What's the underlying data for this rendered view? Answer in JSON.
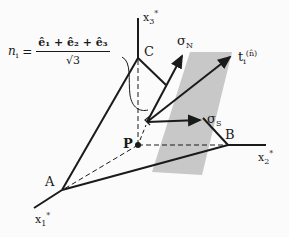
{
  "diagram": {
    "formula": {
      "lhs": "n",
      "lhs_sub": "i",
      "equals": "=",
      "numerator": "ê₁ + ê₂ + ê₃",
      "denominator": "√3"
    },
    "axes": {
      "x1": {
        "label": "x",
        "sub": "1",
        "sup": "*"
      },
      "x2": {
        "label": "x",
        "sub": "2",
        "sup": "*"
      },
      "x3": {
        "label": "x",
        "sub": "3",
        "sup": "*"
      }
    },
    "points": {
      "A": "A",
      "B": "B",
      "C": "C",
      "P": "P"
    },
    "vectors": {
      "sigma_n": {
        "label": "σ",
        "sub": "N"
      },
      "sigma_s": {
        "label": "σ",
        "sub": "S"
      },
      "traction": {
        "label": "t",
        "sub": "i",
        "sup": "(n̂)"
      }
    },
    "colors": {
      "line": "#1a1a1a",
      "plane_fill": "#c8c8c8",
      "background": "#fbfbfb"
    }
  }
}
